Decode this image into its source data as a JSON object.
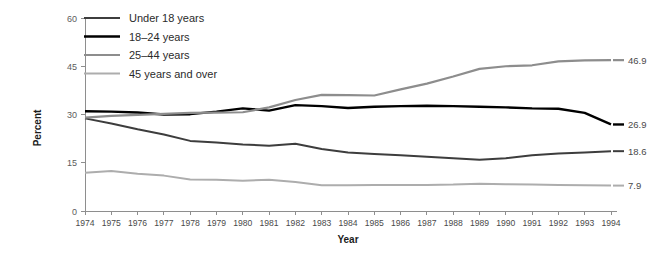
{
  "chart_data": {
    "type": "line",
    "title": "",
    "xlabel": "Year",
    "ylabel": "Percent",
    "ylim": [
      0,
      60
    ],
    "yticks": [
      0,
      15,
      30,
      45,
      60
    ],
    "grid": false,
    "legend_position": "top-left",
    "x": [
      1974,
      1975,
      1976,
      1977,
      1978,
      1979,
      1980,
      1981,
      1982,
      1983,
      1984,
      1985,
      1986,
      1987,
      1988,
      1989,
      1990,
      1991,
      1992,
      1993,
      1994
    ],
    "categories": [
      "1974",
      "1975",
      "1976",
      "1977",
      "1978",
      "1979",
      "1980",
      "1981",
      "1982",
      "1983",
      "1984",
      "1985",
      "1986",
      "1987",
      "1988",
      "1989",
      "1990",
      "1991",
      "1992",
      "1993",
      "1994"
    ],
    "series": [
      {
        "name": "Under 18 years",
        "color": "#3d3d3d",
        "width": 2.0,
        "end_label": "18.6",
        "values": [
          28.8,
          27.2,
          25.4,
          23.8,
          21.8,
          21.3,
          20.7,
          20.3,
          20.9,
          19.3,
          18.2,
          17.7,
          17.3,
          16.9,
          16.4,
          15.9,
          16.4,
          17.3,
          17.9,
          18.2,
          18.6
        ]
      },
      {
        "name": "18–24 years",
        "color": "#000000",
        "width": 2.4,
        "end_label": "26.9",
        "values": [
          31.0,
          30.9,
          30.6,
          30.0,
          30.1,
          30.9,
          31.9,
          31.2,
          32.9,
          32.6,
          32.0,
          32.4,
          32.6,
          32.7,
          32.6,
          32.4,
          32.2,
          31.9,
          31.8,
          30.5,
          26.9
        ]
      },
      {
        "name": "25–44 years",
        "color": "#8d8d8d",
        "width": 2.2,
        "end_label": "46.9",
        "values": [
          29.0,
          29.6,
          29.9,
          30.2,
          30.5,
          30.6,
          30.7,
          32.2,
          34.5,
          36.1,
          36.0,
          35.9,
          37.8,
          39.6,
          41.8,
          44.2,
          45.0,
          45.3,
          46.5,
          46.8,
          46.9
        ]
      },
      {
        "name": "45 years and over",
        "color": "#adadad",
        "width": 2.0,
        "end_label": "7.9",
        "values": [
          11.9,
          12.4,
          11.6,
          11.0,
          9.8,
          9.7,
          9.4,
          9.7,
          9.0,
          8.0,
          8.0,
          8.1,
          8.1,
          8.1,
          8.2,
          8.5,
          8.3,
          8.2,
          8.1,
          8.0,
          7.9
        ]
      }
    ]
  }
}
